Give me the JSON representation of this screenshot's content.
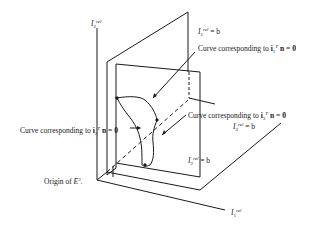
{
  "diagram": {
    "axes": {
      "vertical": {
        "symbol": "I",
        "superscript": "rel",
        "subscript": "2"
      },
      "horizontal": {
        "symbol": "I",
        "superscript": "rel",
        "subscript": "1"
      }
    },
    "labels": {
      "plane1": {
        "symbol": "I",
        "superscript": "rel",
        "subscript": "1",
        "rhs": "= b"
      },
      "plane3": {
        "symbol": "I",
        "superscript": "rel",
        "subscript": "3",
        "rhs": "= b"
      },
      "plane2": {
        "symbol": "I",
        "superscript": "rel",
        "subscript": "2",
        "rhs": "= b"
      },
      "curve1": {
        "text": "Curve corresponding to ",
        "vec": "i",
        "sub": "1",
        "sup": "T",
        "rest": "n = 0"
      },
      "curve3": {
        "text": "Curve corresponding to ",
        "vec": "i",
        "sub": "3",
        "sup": "T",
        "rest": "n = 0"
      },
      "curve2": {
        "text": "Curve corresponding to ",
        "vec": "i",
        "sub": "2",
        "sup": "T",
        "rest": "n = 0"
      },
      "origin": {
        "text": "Origin of ",
        "space": "E",
        "sup": "3",
        "end": "."
      }
    },
    "colors": {
      "line": "#1a1a1a",
      "background": "#ffffff"
    }
  }
}
